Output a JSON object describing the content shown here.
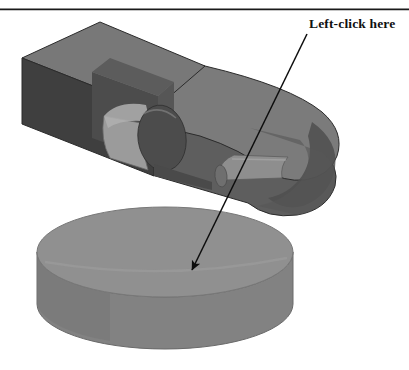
{
  "figure": {
    "background_color": "#ffffff",
    "width": 409,
    "height": 370,
    "top_rule": {
      "name": "top-horizontal-rule",
      "color": "#1a1a1a",
      "y": 9,
      "x_start": 0,
      "x_end": 409,
      "thickness": 1.6
    },
    "callout": {
      "label": "Left-click here",
      "label_color": "#101010",
      "label_x": 309,
      "label_y": 17,
      "font_weight": "bold",
      "arrow": {
        "name": "callout-arrow",
        "color": "#0d0d0d",
        "start_x": 307,
        "start_y": 34,
        "end_x": 190,
        "end_y": 273,
        "stroke_width": 1.5,
        "head_length": 17,
        "head_width": 9
      }
    },
    "parts": [
      {
        "name": "upper-bracket-body",
        "description": "Rectangular block with pocket and protruding boss, joined to a rounded arm",
        "colors": {
          "top_face": "#787878",
          "front_face": "#6e6e6e",
          "left_face": "#404040",
          "pocket_back": "#4a4a4a",
          "pocket_side": "#565656",
          "arm_top": "#7d7d7d",
          "arm_side": "#5e5e5e",
          "arm_end_dark": "#4f4f4f",
          "boss_barrel": "#9a9a9a",
          "boss_cap": "#4c4c4c",
          "peg_barrel": "#8e8e8e",
          "peg_cap": "#575757",
          "outline": "#2b2b2b"
        }
      },
      {
        "name": "lower-disc-part",
        "description": "Cylindrical disc shown below the bracket, the left-click target",
        "colors": {
          "top_face": "#909090",
          "side_wall": "#838383",
          "side_wall_shade": "#777777",
          "outline": "#6a6a6a"
        },
        "geometry": {
          "center_x": 165,
          "top_center_y": 252,
          "radius_x": 128,
          "radius_y": 45,
          "height": 52
        }
      }
    ]
  }
}
